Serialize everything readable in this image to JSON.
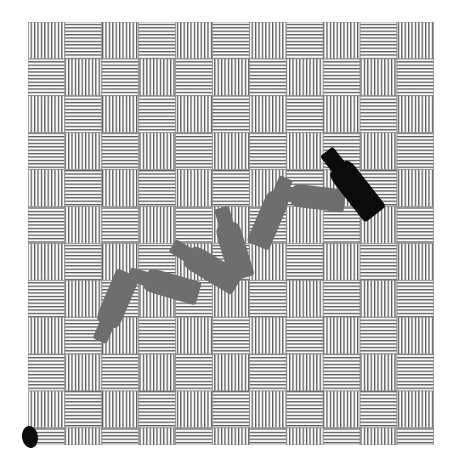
{
  "figure": {
    "type": "illustration",
    "canvas": {
      "width": 461,
      "height": 471,
      "background_color": "#ffffff"
    },
    "background_pattern": {
      "name": "basket-weave-hatch",
      "description": "Checkerboard of square tiles alternating between vertical and horizontal line hatching",
      "origin_x": 28,
      "origin_y": 22,
      "width": 406,
      "height": 423,
      "cell_size": 36.9,
      "columns": 11,
      "rows": 11.45,
      "first_cell_orientation": "vertical",
      "line_color": "#555555",
      "line_spacing": 3.4,
      "line_width": 1.25,
      "tile_fill": "#fbfbfb",
      "border_color": "#8a8a8a"
    },
    "shapes": {
      "gray_color": "#6e6e6e",
      "black_color": "#0b0b0b",
      "items": [
        {
          "id": "bottle-1",
          "label": "gray bottle lower left",
          "color": "gray",
          "center_x": 114,
          "center_y": 307,
          "length": 74,
          "body_width": 25,
          "rotation_deg": 113
        },
        {
          "id": "bottle-2",
          "label": "gray bottle horizontal left",
          "color": "gray",
          "center_x": 164,
          "center_y": 284,
          "length": 72,
          "body_width": 24,
          "rotation_deg": 196
        },
        {
          "id": "bottle-3",
          "label": "gray bottle diagonal center",
          "color": "gray",
          "center_x": 205,
          "center_y": 265,
          "length": 76,
          "body_width": 25,
          "rotation_deg": 211
        },
        {
          "id": "bottle-4",
          "label": "gray bottle upright center",
          "color": "gray",
          "center_x": 232,
          "center_y": 243,
          "length": 74,
          "body_width": 25,
          "rotation_deg": 253
        },
        {
          "id": "bottle-5",
          "label": "gray bottle tilted upper center",
          "color": "gray",
          "center_x": 272,
          "center_y": 212,
          "length": 74,
          "body_width": 24,
          "rotation_deg": 293
        },
        {
          "id": "bottle-6",
          "label": "gray bottle horizontal upper right",
          "color": "gray",
          "center_x": 310,
          "center_y": 197,
          "length": 70,
          "body_width": 23,
          "rotation_deg": 187
        },
        {
          "id": "bottle-7",
          "label": "black bottle upper right",
          "color": "black",
          "center_x": 351,
          "center_y": 183,
          "length": 80,
          "body_width": 27,
          "rotation_deg": 232
        }
      ],
      "marker": {
        "id": "black-ellipse-marker",
        "label": "small black ellipse at lower left margin",
        "color": "black",
        "center_x": 30,
        "center_y": 437,
        "radius_x": 8,
        "radius_y": 11,
        "rotation_deg": -8
      }
    }
  }
}
